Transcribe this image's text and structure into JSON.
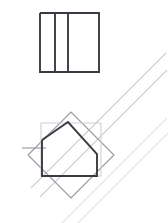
{
  "figure": {
    "canvas": {
      "width": 168,
      "height": 223,
      "background": "#ffffff"
    },
    "colors": {
      "dark_stroke": "#3a3a42",
      "mid_stroke": "#9a9aa0",
      "light_stroke": "#cfcfd4",
      "faint_stroke": "#dcdce0",
      "background": "#ffffff"
    },
    "shapes": {
      "top_square": {
        "name": "square-with-two-vertical-dividers",
        "stroke": "#3a3a42",
        "points": "40,13 99,13 99,72 40,72 40,13",
        "divider_one": "55,13 55,72",
        "divider_two": "68,13 68,72"
      },
      "bottom_pentagon": {
        "name": "pentagon",
        "stroke": "#3a3a42",
        "points": "42,140 68,122 97,154 97,176 42,176 42,140"
      },
      "bottom_axis_square": {
        "name": "axis-aligned-square-outline",
        "stroke": "#cfcfd4",
        "points": "41,123 101,123 101,176 41,176 41,123"
      },
      "rotated_square": {
        "name": "rotated-square-outline",
        "stroke": "#9a9aa0",
        "points": "28,155 71,112 114,155 71,198 28,155"
      },
      "diagonal_band_upper": {
        "name": "diagonal-line-upper",
        "stroke": "#cfcfd4",
        "line": "31,188 166,53"
      },
      "diagonal_band_upper_2": {
        "name": "diagonal-line-upper-second",
        "stroke": "#cfcfd4",
        "line": "40,197 167,70"
      },
      "diagonal_band_lower": {
        "name": "diagonal-line-lower",
        "stroke": "#dcdce0",
        "line": "62,223 167,118"
      },
      "diagonal_band_lower_2": {
        "name": "diagonal-line-lower-second",
        "stroke": "#dcdce0",
        "line": "78,223 168,133"
      },
      "short_tick": {
        "name": "short-tick-mark",
        "stroke": "#9a9aa0",
        "line": "22,148 46,148"
      }
    }
  }
}
